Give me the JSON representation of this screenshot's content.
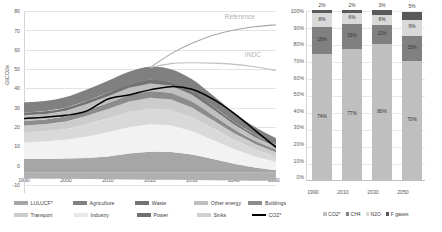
{
  "chart_data": [
    {
      "id": "emissions-pathway",
      "type": "area",
      "title": "",
      "xlabel": "",
      "ylabel": "GtCO2e",
      "xlim": [
        1990,
        2050
      ],
      "ylim": [
        -10,
        80
      ],
      "ytick_labels": [
        "80",
        "70",
        "60",
        "50",
        "40",
        "30",
        "20",
        "10",
        "0",
        "-10"
      ],
      "ytick_values": [
        80,
        70,
        60,
        50,
        40,
        30,
        20,
        10,
        0,
        -10
      ],
      "xtick_labels": [
        "1990",
        "2000",
        "2010",
        "2020",
        "2030",
        "2040",
        "2050"
      ],
      "xtick_values": [
        1990,
        2000,
        2010,
        2020,
        2030,
        2040,
        2050
      ],
      "grid": true,
      "legend_position": "bottom",
      "x": [
        1990,
        1995,
        2000,
        2005,
        2010,
        2015,
        2020,
        2025,
        2030,
        2035,
        2040,
        2045,
        2050
      ],
      "series": [
        {
          "name": "Sinks",
          "color": "#b0b0b0",
          "values": [
            -2.8,
            -2.9,
            -3.0,
            -3.1,
            -3.2,
            -3.3,
            -3.4,
            -3.5,
            -3.6,
            -3.7,
            -3.8,
            -3.9,
            -4.0
          ]
        },
        {
          "name": "LULUCF*",
          "color": "#a6a6a6",
          "values": [
            6.8,
            6.9,
            7.0,
            7.3,
            8.0,
            9.5,
            10.4,
            10.3,
            9.0,
            6.8,
            4.5,
            2.6,
            1.2
          ]
        },
        {
          "name": "Power",
          "color": "#f2f2f2",
          "values": [
            8.2,
            8.6,
            9.3,
            10.6,
            12.0,
            13.1,
            13.6,
            13.2,
            11.6,
            9.4,
            7.2,
            5.4,
            4.1
          ]
        },
        {
          "name": "Industry",
          "color": "#d9d9d9",
          "values": [
            5.1,
            5.0,
            5.3,
            6.1,
            7.0,
            7.6,
            7.9,
            7.7,
            7.0,
            5.8,
            4.6,
            3.6,
            2.8
          ]
        },
        {
          "name": "Transport",
          "color": "#cccccc",
          "values": [
            3.3,
            3.5,
            3.8,
            4.2,
            4.6,
            5.0,
            5.2,
            5.1,
            4.7,
            4.0,
            3.3,
            2.6,
            2.1
          ]
        },
        {
          "name": "Buildings",
          "color": "#8c8c8c",
          "values": [
            2.4,
            2.4,
            2.5,
            2.7,
            2.9,
            3.1,
            3.2,
            3.1,
            2.9,
            2.5,
            2.0,
            1.6,
            1.3
          ]
        },
        {
          "name": "Other energy",
          "color": "#bfbfbf",
          "values": [
            2.6,
            2.6,
            2.8,
            3.1,
            3.4,
            3.7,
            3.8,
            3.7,
            3.4,
            2.9,
            2.3,
            1.8,
            1.4
          ]
        },
        {
          "name": "Waste",
          "color": "#737373",
          "values": [
            1.4,
            1.4,
            1.5,
            1.6,
            1.7,
            1.8,
            1.9,
            1.8,
            1.7,
            1.5,
            1.3,
            1.1,
            0.9
          ]
        },
        {
          "name": "Agriculture",
          "color": "#808080",
          "values": [
            5.0,
            5.1,
            5.3,
            5.6,
            5.9,
            6.2,
            6.4,
            6.3,
            5.9,
            5.3,
            4.6,
            3.9,
            3.3
          ]
        }
      ],
      "lines": [
        {
          "name": "CO2*",
          "color": "#000000",
          "values": [
            26.8,
            27.5,
            28.4,
            30.6,
            36.5,
            38.5,
            41.0,
            42.6,
            41.3,
            36.4,
            29.4,
            21.0,
            12.6
          ]
        },
        {
          "name": "Reference",
          "color": "#a6a6a6",
          "values": [
            null,
            null,
            null,
            null,
            null,
            null,
            52.0,
            58.8,
            64.0,
            68.0,
            70.6,
            72.2,
            73.2
          ]
        },
        {
          "name": "INDC",
          "color": "#bfbfbf",
          "values": [
            null,
            null,
            null,
            null,
            null,
            null,
            52.0,
            54.0,
            54.4,
            54.2,
            53.6,
            52.4,
            50.6
          ]
        }
      ],
      "annotations": [
        {
          "text": "Reference",
          "x": 2043,
          "y": 77
        },
        {
          "text": "INDC",
          "x": 2044,
          "y": 58
        }
      ],
      "legend_entries": [
        {
          "label": "LULUCF*",
          "color": "#a6a6a6",
          "kind": "area"
        },
        {
          "label": "Agriculture",
          "color": "#808080",
          "kind": "area"
        },
        {
          "label": "Waste",
          "color": "#737373",
          "kind": "area"
        },
        {
          "label": "Other energy",
          "color": "#bfbfbf",
          "kind": "area"
        },
        {
          "label": "Buildings",
          "color": "#8c8c8c",
          "kind": "area"
        },
        {
          "label": "Transport",
          "color": "#cccccc",
          "kind": "area"
        },
        {
          "label": "Industry",
          "color": "#e8e8e8",
          "kind": "area"
        },
        {
          "label": "Power",
          "color": "#707070",
          "kind": "area"
        },
        {
          "label": "Sinks",
          "color": "#d0d0d0",
          "kind": "area"
        },
        {
          "label": "CO2*",
          "color": "#000000",
          "kind": "line"
        }
      ]
    },
    {
      "id": "gas-composition",
      "type": "bar",
      "stacked": true,
      "title": "",
      "xlabel": "",
      "ylabel": "",
      "ylim": [
        0,
        100
      ],
      "ytick_labels": [
        "100%",
        "90%",
        "80%",
        "70%",
        "60%",
        "50%",
        "40%",
        "30%",
        "20%",
        "10%",
        "0%"
      ],
      "ytick_values": [
        100,
        90,
        80,
        70,
        60,
        50,
        40,
        30,
        20,
        10,
        0
      ],
      "categories": [
        "1990",
        "2010",
        "2030",
        "2050"
      ],
      "grid": true,
      "legend_position": "bottom",
      "series": [
        {
          "name": "CO2*",
          "color": "#bfbfbf",
          "values": [
            74,
            77,
            80,
            70
          ],
          "labels": [
            "74%",
            "77%",
            "80%",
            "70%"
          ]
        },
        {
          "name": "CH4",
          "color": "#808080",
          "values": [
            16,
            15,
            11,
            15
          ],
          "labels": [
            "16%",
            "15%",
            "11%",
            "15%"
          ]
        },
        {
          "name": "N2O",
          "color": "#d9d9d9",
          "values": [
            8,
            6,
            6,
            9
          ],
          "labels": [
            "8%",
            "6%",
            "6%",
            "9%"
          ]
        },
        {
          "name": "F gases",
          "color": "#595959",
          "values": [
            2,
            2,
            3,
            5
          ],
          "labels": [
            "2%",
            "2%",
            "3%",
            "5%"
          ]
        }
      ],
      "legend_entries": [
        {
          "label": "CO2*",
          "color": "#bfbfbf"
        },
        {
          "label": "CH4",
          "color": "#808080"
        },
        {
          "label": "N2O",
          "color": "#d9d9d9"
        },
        {
          "label": "F gases",
          "color": "#595959"
        }
      ]
    }
  ]
}
